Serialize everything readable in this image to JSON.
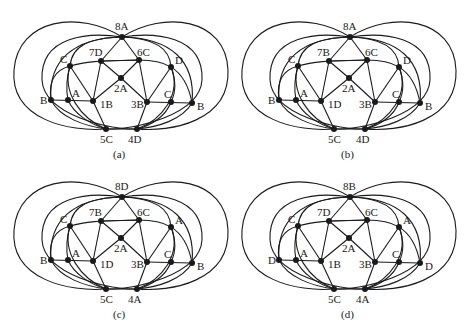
{
  "figure": {
    "panels": [
      {
        "caption": "(a)",
        "labels": {
          "top": "8A",
          "upper_left_inner": "7D",
          "upper_right_inner": "6C",
          "left_upper": "C",
          "right_upper": "D",
          "center": "2A",
          "left_outer": "B",
          "left_inner": "A",
          "left_mid": "1B",
          "right_mid": "3B",
          "right_inner": "C",
          "right_outer": "B",
          "bottom_left": "5C",
          "bottom_right": "4D"
        }
      },
      {
        "caption": "(b)",
        "labels": {
          "top": "8A",
          "upper_left_inner": "7B",
          "upper_right_inner": "6C",
          "left_upper": "C",
          "right_upper": "D",
          "center": "2A",
          "left_outer": "B",
          "left_inner": "A",
          "left_mid": "1D",
          "right_mid": "3B",
          "right_inner": "C",
          "right_outer": "B",
          "bottom_left": "5C",
          "bottom_right": "4D"
        }
      },
      {
        "caption": "(c)",
        "labels": {
          "top": "8D",
          "upper_left_inner": "7B",
          "upper_right_inner": "6C",
          "left_upper": "C",
          "right_upper": "A",
          "center": "2A",
          "left_outer": "B",
          "left_inner": "A",
          "left_mid": "1D",
          "right_mid": "3B",
          "right_inner": "C",
          "right_outer": "B",
          "bottom_left": "5C",
          "bottom_right": "4A"
        }
      },
      {
        "caption": "(d)",
        "labels": {
          "top": "8B",
          "upper_left_inner": "7D",
          "upper_right_inner": "6C",
          "left_upper": "C",
          "right_upper": "A",
          "center": "2A",
          "left_outer": "D",
          "left_inner": "A",
          "left_mid": "1B",
          "right_mid": "3B",
          "right_inner": "C",
          "right_outer": "D",
          "bottom_left": "5C",
          "bottom_right": "4A"
        }
      }
    ]
  }
}
